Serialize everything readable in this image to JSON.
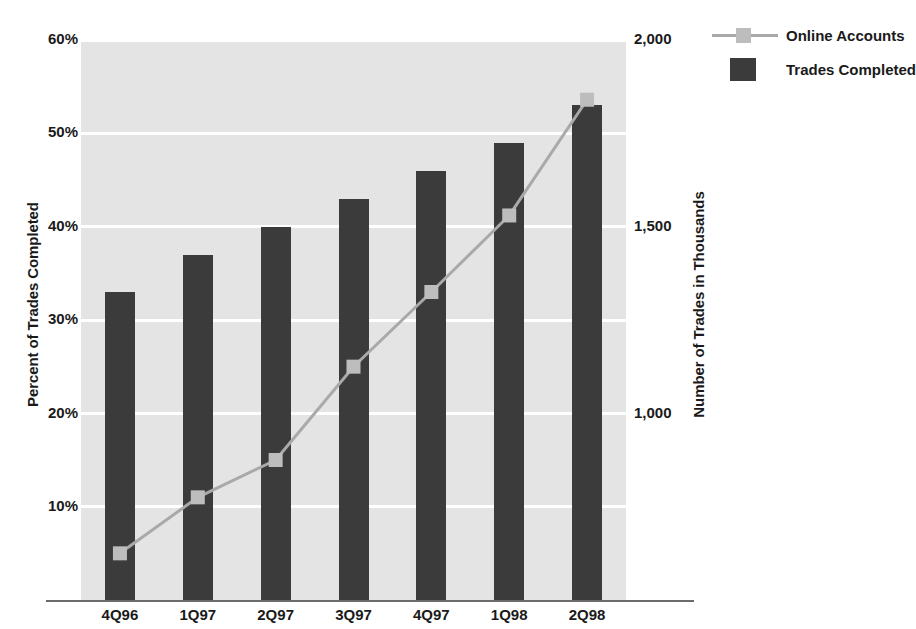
{
  "chart_data": {
    "type": "bar",
    "title": "",
    "categories": [
      "4Q96",
      "1Q97",
      "2Q97",
      "3Q97",
      "4Q97",
      "1Q98",
      "2Q98"
    ],
    "xlabel": "",
    "series": [
      {
        "name": "Trades Completed",
        "type": "bar",
        "axis": "left",
        "color": "#3b3b3b",
        "values": [
          33,
          37,
          40,
          43,
          46,
          49,
          53
        ]
      },
      {
        "name": "Online Accounts",
        "type": "line",
        "axis": "right",
        "color": "#a9a9a9",
        "marker_color": "#bdbdbd",
        "values": [
          625,
          775,
          875,
          1125,
          1325,
          1530,
          1840
        ]
      }
    ],
    "left_axis": {
      "label": "Percent of Trades Completed",
      "ticks": [
        "10%",
        "20%",
        "30%",
        "40%",
        "50%",
        "60%"
      ],
      "tick_values": [
        10,
        20,
        30,
        40,
        50,
        60
      ],
      "ylim": [
        0,
        60
      ]
    },
    "right_axis": {
      "label": "Number of Trades in Thousands",
      "ticks": [
        "1,000",
        "1,500",
        "2,000"
      ],
      "tick_values": [
        1000,
        1500,
        2000
      ],
      "ylim": [
        500,
        2000
      ]
    },
    "grid": true,
    "legend_position": "top-right",
    "plot_background": "#e4e4e4",
    "gridline_color": "#ffffff"
  },
  "legend": {
    "items": [
      {
        "label": "Online Accounts",
        "key": "line-with-square-marker"
      },
      {
        "label": "Trades Completed",
        "key": "filled-square"
      }
    ]
  }
}
